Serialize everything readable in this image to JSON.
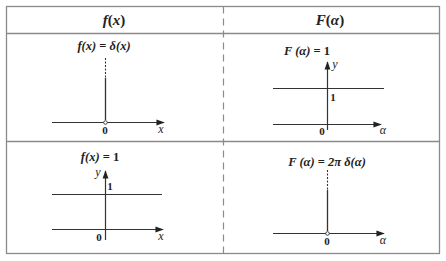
{
  "table": {
    "headers": [
      {
        "fn": "f",
        "arg": "x"
      },
      {
        "fn": "F",
        "arg": "α"
      }
    ],
    "cells": [
      {
        "title_lhs": "f(x)",
        "title_eq": " = ",
        "title_rhs": "δ(x)",
        "kind": "delta",
        "origin_label": "0",
        "x_label": "x"
      },
      {
        "title_lhs": "F (α)",
        "title_eq": " = ",
        "title_rhs": "1",
        "kind": "constant",
        "origin_label": "0",
        "x_label": "α",
        "y_label": "y",
        "level_label": "1"
      },
      {
        "title_lhs": "f(x)",
        "title_eq": " = ",
        "title_rhs": "1",
        "kind": "constant",
        "origin_label": "0",
        "x_label": "x",
        "y_label": "y",
        "level_label": "1"
      },
      {
        "title_lhs": "F (α)",
        "title_eq": " = ",
        "title_rhs": "2π δ(α)",
        "kind": "delta",
        "origin_label": "0",
        "x_label": "α"
      }
    ]
  },
  "colors": {
    "border": "#8a8a8a",
    "line": "#333333",
    "text": "#222222"
  }
}
